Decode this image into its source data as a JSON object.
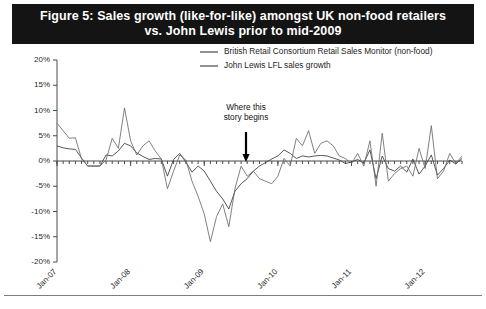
{
  "figure": {
    "title_line1": "Figure 5: Sales growth (like-for-like) amongst UK non-food retailers",
    "title_line2": "vs. John Lewis prior to mid-2009",
    "banner_color": "#141414",
    "banner_text_color": "#ffffff"
  },
  "annotation": {
    "line1": "Where this",
    "line2": "story begins",
    "at_x": "Jan-09.5",
    "arrow": "down-arrow"
  },
  "legend": {
    "position": "top-inside",
    "entries": [
      {
        "label": "British Retail Consortium Retail Sales Monitor (non-food)",
        "color": "#3a3a3a"
      },
      {
        "label": "John Lewis LFL sales growth",
        "color": "#6a6a6a"
      }
    ]
  },
  "chart_data": {
    "type": "line",
    "title": "Figure 5: Sales growth (like-for-like) amongst UK non-food retailers vs. John Lewis prior to mid-2009",
    "xlabel": "",
    "ylabel": "",
    "grid": false,
    "ylim": [
      -20,
      20
    ],
    "yticks": [
      20,
      15,
      10,
      5,
      0,
      -5,
      -10,
      -15,
      -20
    ],
    "ytick_labels": [
      "20%",
      "15%",
      "10%",
      "5%",
      "0%",
      "-5%",
      "-10%",
      "-15%",
      "-20%"
    ],
    "xtick_labels": [
      "Jan-07",
      "Jan-08",
      "Jan-09",
      "Jan-10",
      "Jan-11",
      "Jan-12"
    ],
    "xtick_positions": [
      0,
      12,
      24,
      36,
      48,
      60
    ],
    "x_rotation": 45,
    "x_minor_ticks": "monthly",
    "x": [
      "Jan-07",
      "Feb-07",
      "Mar-07",
      "Apr-07",
      "May-07",
      "Jun-07",
      "Jul-07",
      "Aug-07",
      "Sep-07",
      "Oct-07",
      "Nov-07",
      "Dec-07",
      "Jan-08",
      "Feb-08",
      "Mar-08",
      "Apr-08",
      "May-08",
      "Jun-08",
      "Jul-08",
      "Aug-08",
      "Sep-08",
      "Oct-08",
      "Nov-08",
      "Dec-08",
      "Jan-09",
      "Feb-09",
      "Mar-09",
      "Apr-09",
      "May-09",
      "Jun-09",
      "Jul-09",
      "Aug-09",
      "Sep-09",
      "Oct-09",
      "Nov-09",
      "Dec-09",
      "Jan-10",
      "Feb-10",
      "Mar-10",
      "Apr-10",
      "May-10",
      "Jun-10",
      "Jul-10",
      "Aug-10",
      "Sep-10",
      "Oct-10",
      "Nov-10",
      "Dec-10",
      "Jan-11",
      "Feb-11",
      "Mar-11",
      "Apr-11",
      "May-11",
      "Jun-11",
      "Jul-11",
      "Aug-11",
      "Sep-11",
      "Oct-11",
      "Nov-11",
      "Dec-11",
      "Jan-12",
      "Feb-12",
      "Mar-12",
      "Apr-12",
      "May-12",
      "Jun-12",
      "Jul-12"
    ],
    "series": [
      {
        "name": "British Retail Consortium Retail Sales Monitor (non-food)",
        "color": "#3a3a3a",
        "values": [
          3.0,
          2.6,
          2.4,
          2.3,
          0.6,
          -1.0,
          -1.0,
          -1.0,
          1.2,
          1.0,
          2.0,
          3.5,
          3.0,
          1.6,
          0.9,
          0.3,
          0.5,
          0.4,
          -3.0,
          0.3,
          1.5,
          -0.2,
          -2.2,
          -1.0,
          -2.0,
          -4.0,
          -6.0,
          -7.5,
          -9.5,
          -6.0,
          -4.5,
          -3.5,
          -2.0,
          -1.0,
          -0.3,
          0.4,
          1.0,
          2.2,
          1.5,
          0.5,
          1.0,
          0.8,
          1.0,
          1.1,
          1.0,
          0.6,
          0.2,
          -0.5,
          -0.2,
          0.3,
          -0.4,
          2.2,
          -3.5,
          1.0,
          -1.5,
          -2.0,
          -1.0,
          -2.2,
          0.4,
          -2.6,
          -1.0,
          1.2,
          -2.8,
          -1.5,
          0.2,
          -0.6,
          0.5
        ]
      },
      {
        "name": "John Lewis LFL sales growth",
        "color": "#6a6a6a",
        "values": [
          7.5,
          6.0,
          4.5,
          4.6,
          0.4,
          -1.0,
          -1.0,
          -1.0,
          0.2,
          4.5,
          2.5,
          10.5,
          4.0,
          1.2,
          3.0,
          4.0,
          2.0,
          0.4,
          -5.5,
          -2.0,
          1.2,
          0.2,
          -4.0,
          -7.0,
          -10.5,
          -16.0,
          -11.0,
          -8.5,
          -13.0,
          -5.5,
          -1.0,
          -3.0,
          -2.0,
          -3.5,
          -4.0,
          -4.5,
          -3.0,
          0.5,
          -1.0,
          4.5,
          3.0,
          6.0,
          1.5,
          3.5,
          4.0,
          3.0,
          1.0,
          0.5,
          -0.5,
          1.5,
          -1.0,
          4.0,
          -5.0,
          5.5,
          -4.0,
          -2.5,
          -1.5,
          -1.0,
          -3.0,
          2.5,
          -1.5,
          7.0,
          -3.5,
          -2.0,
          1.5,
          -0.5,
          1.0
        ]
      }
    ]
  }
}
